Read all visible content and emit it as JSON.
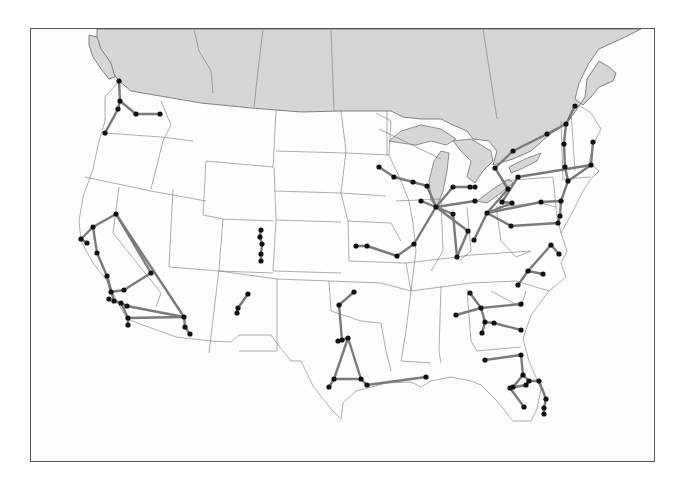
{
  "map": {
    "title": "",
    "frame": {
      "x": 30,
      "y": 28,
      "width": 625,
      "height": 434
    },
    "colors": {
      "canada": "#d6d6d6",
      "land": "#ffffff",
      "route": "#7a7a7a",
      "node": "#111111",
      "border": "#555555"
    },
    "regions_shaded": [
      "Canada",
      "Great Lakes"
    ],
    "networks": [
      {
        "name": "Pacific Northwest",
        "nodes": [
          [
            118,
            80
          ],
          [
            119,
            100
          ],
          [
            117,
            108
          ],
          [
            135,
            113
          ],
          [
            159,
            113
          ],
          [
            104,
            132
          ]
        ],
        "edges": [
          [
            0,
            1
          ],
          [
            1,
            2
          ],
          [
            1,
            3
          ],
          [
            3,
            4
          ],
          [
            2,
            5
          ]
        ]
      },
      {
        "name": "California",
        "nodes": [
          [
            115,
            213
          ],
          [
            92,
            226
          ],
          [
            80,
            238
          ],
          [
            86,
            242
          ],
          [
            96,
            252
          ],
          [
            106,
            275
          ],
          [
            110,
            291
          ],
          [
            108,
            298
          ],
          [
            123,
            289
          ],
          [
            113,
            300
          ],
          [
            120,
            302
          ],
          [
            126,
            305
          ],
          [
            150,
            272
          ],
          [
            183,
            316
          ],
          [
            184,
            326
          ],
          [
            127,
            317
          ],
          [
            127,
            324
          ],
          [
            189,
            333
          ]
        ],
        "edges": [
          [
            0,
            1
          ],
          [
            1,
            2
          ],
          [
            2,
            3
          ],
          [
            1,
            4
          ],
          [
            4,
            5
          ],
          [
            5,
            6
          ],
          [
            6,
            8
          ],
          [
            8,
            12
          ],
          [
            12,
            0
          ],
          [
            0,
            13
          ],
          [
            5,
            9
          ],
          [
            9,
            10
          ],
          [
            10,
            15
          ],
          [
            15,
            13
          ],
          [
            10,
            11
          ],
          [
            11,
            13
          ],
          [
            13,
            14
          ],
          [
            14,
            17
          ],
          [
            15,
            16
          ]
        ]
      },
      {
        "name": "Colorado",
        "nodes": [
          [
            260,
            229
          ],
          [
            259,
            236
          ],
          [
            261,
            243
          ],
          [
            260,
            253
          ],
          [
            260,
            260
          ]
        ],
        "edges": [
          [
            0,
            1
          ],
          [
            1,
            2
          ],
          [
            2,
            3
          ],
          [
            3,
            4
          ]
        ]
      },
      {
        "name": "New Mexico",
        "nodes": [
          [
            247,
            293
          ],
          [
            237,
            307
          ],
          [
            236,
            312
          ]
        ],
        "edges": [
          [
            0,
            1
          ],
          [
            1,
            2
          ]
        ]
      },
      {
        "name": "Texas",
        "nodes": [
          [
            353,
            291
          ],
          [
            338,
            304
          ],
          [
            337,
            340
          ],
          [
            341,
            339
          ],
          [
            347,
            337
          ],
          [
            333,
            378
          ],
          [
            360,
            378
          ],
          [
            328,
            386
          ],
          [
            366,
            384
          ],
          [
            425,
            376
          ]
        ],
        "edges": [
          [
            0,
            1
          ],
          [
            1,
            3
          ],
          [
            3,
            4
          ],
          [
            4,
            5
          ],
          [
            4,
            6
          ],
          [
            5,
            6
          ],
          [
            5,
            7
          ],
          [
            6,
            8
          ],
          [
            8,
            9
          ]
        ]
      },
      {
        "name": "Midwest",
        "nodes": [
          [
            378,
            166
          ],
          [
            393,
            176
          ],
          [
            412,
            181
          ],
          [
            426,
            185
          ],
          [
            420,
            200
          ],
          [
            435,
            206
          ],
          [
            452,
            186
          ],
          [
            469,
            186
          ],
          [
            474,
            186
          ],
          [
            474,
            200
          ],
          [
            413,
            243
          ],
          [
            396,
            255
          ],
          [
            366,
            245
          ],
          [
            355,
            245
          ],
          [
            467,
            230
          ],
          [
            456,
            256
          ],
          [
            452,
            213
          ]
        ],
        "edges": [
          [
            0,
            1
          ],
          [
            1,
            2
          ],
          [
            2,
            3
          ],
          [
            3,
            5
          ],
          [
            4,
            5
          ],
          [
            5,
            6
          ],
          [
            6,
            7
          ],
          [
            7,
            8
          ],
          [
            5,
            9
          ],
          [
            5,
            10
          ],
          [
            10,
            11
          ],
          [
            11,
            12
          ],
          [
            12,
            13
          ],
          [
            5,
            14
          ],
          [
            14,
            15
          ],
          [
            5,
            16
          ],
          [
            16,
            15
          ]
        ]
      },
      {
        "name": "Great Lakes / Northeast",
        "nodes": [
          [
            494,
            167
          ],
          [
            512,
            150
          ],
          [
            546,
            133
          ],
          [
            565,
            123
          ],
          [
            574,
            105
          ],
          [
            563,
            143
          ],
          [
            564,
            166
          ],
          [
            592,
            141
          ],
          [
            590,
            164
          ],
          [
            567,
            180
          ],
          [
            517,
            176
          ],
          [
            507,
            188
          ],
          [
            501,
            201
          ],
          [
            486,
            212
          ],
          [
            511,
            202
          ],
          [
            540,
            201
          ],
          [
            560,
            200
          ],
          [
            559,
            215
          ],
          [
            557,
            222
          ],
          [
            510,
            225
          ],
          [
            473,
            239
          ]
        ],
        "edges": [
          [
            0,
            1
          ],
          [
            1,
            2
          ],
          [
            2,
            3
          ],
          [
            3,
            4
          ],
          [
            3,
            5
          ],
          [
            5,
            6
          ],
          [
            6,
            9
          ],
          [
            7,
            8
          ],
          [
            8,
            9
          ],
          [
            10,
            8
          ],
          [
            0,
            11
          ],
          [
            11,
            13
          ],
          [
            13,
            14
          ],
          [
            14,
            12
          ],
          [
            13,
            20
          ],
          [
            13,
            15
          ],
          [
            15,
            16
          ],
          [
            16,
            9
          ],
          [
            16,
            17
          ],
          [
            17,
            18
          ],
          [
            13,
            19
          ],
          [
            19,
            18
          ],
          [
            12,
            10
          ]
        ]
      },
      {
        "name": "Mid-Atlantic / Carolinas",
        "nodes": [
          [
            550,
            244
          ],
          [
            558,
            253
          ],
          [
            527,
            270
          ],
          [
            542,
            273
          ],
          [
            517,
            284
          ]
        ],
        "edges": [
          [
            0,
            1
          ],
          [
            0,
            2
          ],
          [
            2,
            3
          ],
          [
            2,
            4
          ]
        ]
      },
      {
        "name": "Southeast",
        "nodes": [
          [
            469,
            292
          ],
          [
            480,
            307
          ],
          [
            520,
            303
          ],
          [
            455,
            314
          ],
          [
            484,
            321
          ],
          [
            493,
            322
          ],
          [
            520,
            329
          ],
          [
            481,
            332
          ],
          [
            520,
            354
          ],
          [
            484,
            359
          ],
          [
            522,
            374
          ],
          [
            528,
            380
          ],
          [
            525,
            384
          ],
          [
            538,
            380
          ],
          [
            512,
            386
          ],
          [
            509,
            387
          ],
          [
            523,
            406
          ],
          [
            545,
            398
          ],
          [
            543,
            407
          ],
          [
            543,
            413
          ]
        ],
        "edges": [
          [
            0,
            1
          ],
          [
            1,
            2
          ],
          [
            3,
            1
          ],
          [
            1,
            4
          ],
          [
            4,
            5
          ],
          [
            5,
            6
          ],
          [
            4,
            7
          ],
          [
            9,
            8
          ],
          [
            8,
            10
          ],
          [
            10,
            11
          ],
          [
            11,
            13
          ],
          [
            11,
            12
          ],
          [
            12,
            15
          ],
          [
            15,
            16
          ],
          [
            13,
            17
          ],
          [
            17,
            18
          ],
          [
            18,
            19
          ],
          [
            10,
            14
          ]
        ]
      }
    ]
  }
}
